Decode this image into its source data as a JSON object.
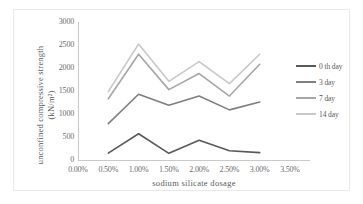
{
  "chart_data": {
    "type": "line",
    "title": "",
    "xlabel": "sodium  silicate  dosage",
    "ylabel": "unconfined  compressive  strength  (kN/m²)",
    "x": [
      0.5,
      1.0,
      1.5,
      2.0,
      2.5,
      3.0
    ],
    "xtick_labels": [
      "0.00%",
      "0.50%",
      "1.00%",
      "1.50%",
      "2.00%",
      "2.50%",
      "3.00%",
      "3.50%"
    ],
    "xtick_values": [
      0.0,
      0.5,
      1.0,
      1.5,
      2.0,
      2.5,
      3.0,
      3.5
    ],
    "ytick_labels": [
      "0",
      "500",
      "1000",
      "1500",
      "2000",
      "2500",
      "3000"
    ],
    "ytick_values": [
      0,
      500,
      1000,
      1500,
      2000,
      2500,
      3000
    ],
    "xlim": [
      0.0,
      3.5
    ],
    "ylim": [
      0,
      3000
    ],
    "grid": false,
    "legend_position": "right",
    "series": [
      {
        "name": "0 th day",
        "color": "#595959",
        "values": [
          150,
          570,
          145,
          430,
          200,
          160
        ]
      },
      {
        "name": "3 day",
        "color": "#7f7f7f",
        "values": [
          790,
          1430,
          1190,
          1390,
          1090,
          1260
        ]
      },
      {
        "name": "7 day",
        "color": "#a6a6a6",
        "values": [
          1330,
          2300,
          1530,
          1880,
          1390,
          2080
        ]
      },
      {
        "name": "14 day",
        "color": "#c9c9c9",
        "values": [
          1490,
          2520,
          1710,
          2140,
          1660,
          2300
        ]
      }
    ]
  },
  "legend": {
    "items": [
      {
        "label": "0 th day"
      },
      {
        "label": "3 day"
      },
      {
        "label": "7 day"
      },
      {
        "label": "14 day"
      }
    ]
  }
}
